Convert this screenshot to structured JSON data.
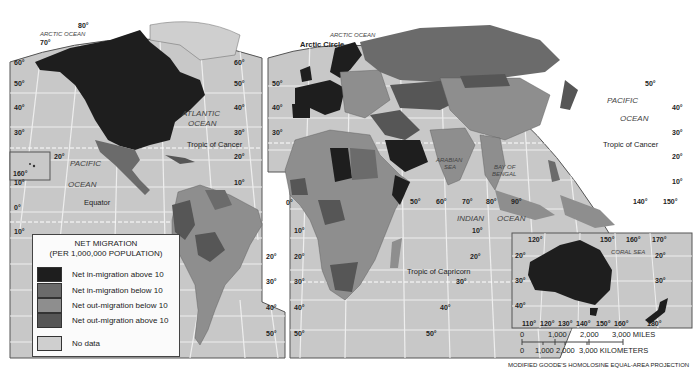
{
  "legend": {
    "title_line1": "NET MIGRATION",
    "title_line2": "(PER 1,000,000 POPULATION)",
    "items": [
      {
        "label": "Net in-migration above 10",
        "color": "#1e1e1e"
      },
      {
        "label": "Net in-migration below 10",
        "color": "#6b6b6b"
      },
      {
        "label": "Net out-migration below 10",
        "color": "#8e8e8e"
      },
      {
        "label": "Net out-migration above 10",
        "color": "#565656"
      },
      {
        "label": "No data",
        "color": "#cfcfcf"
      }
    ]
  },
  "oceans": {
    "arctic_left": "ARCTIC OCEAN",
    "arctic_right": "ARCTIC OCEAN",
    "atlantic_1": "ATLANTIC",
    "atlantic_2": "OCEAN",
    "pacific_left_1": "PACIFIC",
    "pacific_left_2": "OCEAN",
    "pacific_right_1": "PACIFIC",
    "pacific_right_2": "OCEAN",
    "indian_1": "INDIAN",
    "indian_2": "OCEAN",
    "arabian_1": "ARABIAN",
    "arabian_2": "SEA",
    "bengal_1": "BAY OF",
    "bengal_2": "BENGAL",
    "coral": "CORAL SEA"
  },
  "lines": {
    "arctic_circle": "Arctic Circle",
    "tropic_cancer_left": "Tropic of Cancer",
    "tropic_cancer_right": "Tropic of Cancer",
    "equator": "Equator",
    "tropic_capricorn": "Tropic of Capricorn"
  },
  "latitude_labels": {
    "left": [
      "70°",
      "60°",
      "50°",
      "40°",
      "30°",
      "20°",
      "10°",
      "0°",
      "10°"
    ],
    "americas_right": [
      "80°",
      "60°",
      "50°",
      "40°",
      "30°",
      "20°",
      "10°"
    ],
    "eurasia_left": [
      "60°",
      "50°",
      "40°",
      "30°"
    ],
    "south_america_right": [
      "20°",
      "30°",
      "40°",
      "50°"
    ],
    "africa_left": [
      "10°",
      "20°",
      "30°",
      "40°",
      "50°"
    ],
    "africa_right": [
      "10°",
      "20°",
      "30°",
      "40°",
      "50°"
    ],
    "asia_right": [
      "50°",
      "40°",
      "30°",
      "20°",
      "10°"
    ],
    "hawaii": "160°",
    "hawaii_lat": "20°"
  },
  "longitude_labels": {
    "prime": "0°",
    "asia": [
      "50°",
      "60°",
      "70°",
      "80°",
      "90°"
    ],
    "pacific": [
      "140°",
      "150°"
    ]
  },
  "australia_inset": {
    "top_labels": [
      "120°",
      "150°",
      "160°",
      "170°"
    ],
    "bottom_labels": [
      "110°",
      "120°",
      "130°",
      "140°",
      "150°",
      "160°",
      "180°"
    ],
    "lat_left": [
      "20°",
      "30°",
      "40°"
    ],
    "lat_right": [
      "20°",
      "30°"
    ]
  },
  "scale": {
    "miles": [
      "0",
      "1,000",
      "2,000",
      "3,000 MILES"
    ],
    "km": [
      "0",
      "1,000",
      "2,000",
      "3,000 KILOMETERS"
    ]
  },
  "projection": "MODIFIED GOODE'S HOMOLOSINE EQUAL-AREA PROJECTION"
}
